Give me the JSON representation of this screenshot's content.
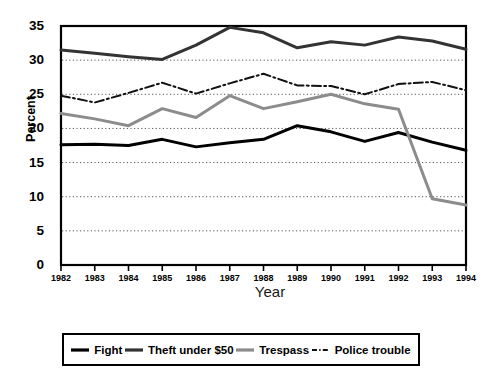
{
  "chart_data": {
    "type": "line",
    "title": "",
    "xlabel": "Year",
    "ylabel": "Percent",
    "categories": [
      "1982",
      "1983",
      "1984",
      "1985",
      "1986",
      "1987",
      "1988",
      "1989",
      "1990",
      "1991",
      "1992",
      "1993",
      "1994"
    ],
    "x": [
      1982,
      1983,
      1984,
      1985,
      1986,
      1987,
      1988,
      1989,
      1990,
      1991,
      1992,
      1993,
      1994
    ],
    "xlim": [
      1982,
      1994
    ],
    "ylim": [
      0,
      35
    ],
    "yticks": [
      0,
      5,
      10,
      15,
      20,
      25,
      30,
      35
    ],
    "grid": "horizontal-dotted",
    "legend_position": "below-plot",
    "series": [
      {
        "name": "Fight",
        "color": "#000000",
        "style": "solid",
        "width": 3,
        "values": [
          17.6,
          17.7,
          17.5,
          18.4,
          17.3,
          17.9,
          18.4,
          20.4,
          19.5,
          18.1,
          19.4,
          18.0,
          16.8
        ]
      },
      {
        "name": "Theft under $50",
        "color": "#333333",
        "style": "solid",
        "width": 3,
        "values": [
          31.5,
          31.0,
          30.5,
          30.1,
          32.2,
          34.8,
          34.0,
          31.8,
          32.7,
          32.2,
          33.4,
          32.8,
          31.6
        ]
      },
      {
        "name": "Trespass",
        "color": "#8c8c8c",
        "style": "solid",
        "width": 3,
        "values": [
          22.2,
          21.4,
          20.4,
          22.9,
          21.6,
          24.8,
          22.9,
          23.9,
          25.0,
          23.6,
          22.8,
          9.7,
          8.8
        ]
      },
      {
        "name": "Police trouble",
        "color": "#111111",
        "style": "dashdot",
        "width": 2,
        "values": [
          24.8,
          23.8,
          25.2,
          26.7,
          25.1,
          26.6,
          28.0,
          26.3,
          26.2,
          25.0,
          26.5,
          26.8,
          25.6
        ]
      }
    ]
  },
  "legend": {
    "items": [
      {
        "label": "Fight"
      },
      {
        "label": "Theft under $50"
      },
      {
        "label": "Trespass"
      },
      {
        "label": "Police trouble"
      }
    ]
  },
  "axes": {
    "y_title": "Percent",
    "x_title": "Year",
    "y_tick_labels": [
      "35",
      "30",
      "25",
      "20",
      "15",
      "10",
      "5",
      "0"
    ],
    "x_tick_labels": [
      "1982",
      "1983",
      "1984",
      "1985",
      "1986",
      "1987",
      "1988",
      "1989",
      "1990",
      "1991",
      "1992",
      "1993",
      "1994"
    ]
  }
}
